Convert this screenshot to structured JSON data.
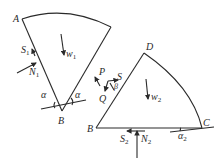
{
  "diagram": {
    "title": "",
    "left_block": {
      "vertices": {
        "A": "A",
        "B": "B"
      },
      "weight": {
        "symbol": "w",
        "subscript": "1"
      },
      "friction": {
        "symbol": "S",
        "subscript": "1"
      },
      "normal": {
        "symbol": "N",
        "subscript": "1"
      },
      "angle_left": "α",
      "angle_right": "α"
    },
    "right_block": {
      "vertices": {
        "D": "D",
        "B": "B",
        "C": "C"
      },
      "weight": {
        "symbol": "w",
        "subscript": "2"
      },
      "friction": {
        "symbol": "S",
        "subscript": "2"
      },
      "normal": {
        "symbol": "N",
        "subscript": "2"
      },
      "angle": {
        "symbol": "α",
        "subscript": "2"
      }
    },
    "interface_forces": {
      "P": "P",
      "Q": "Q",
      "S": "S",
      "beta": "β"
    }
  }
}
